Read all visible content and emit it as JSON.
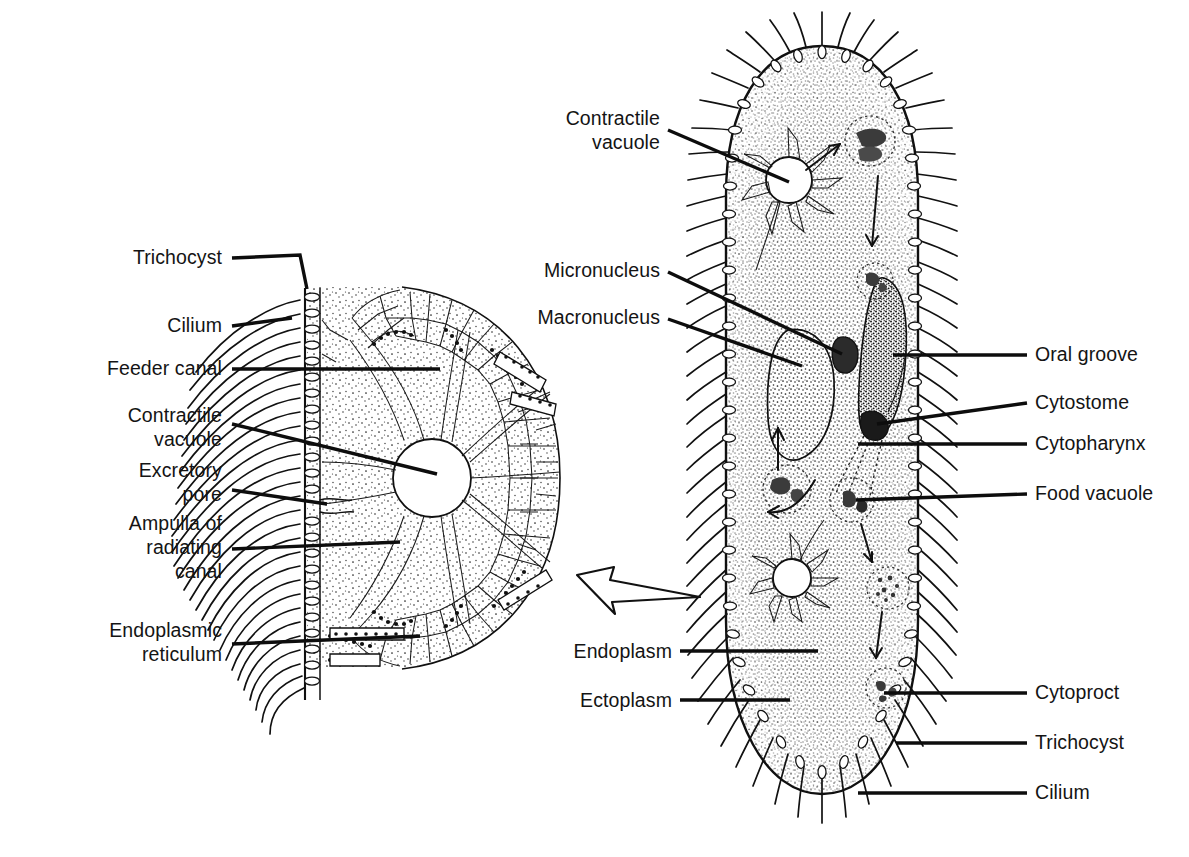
{
  "figure": {
    "background": "#ffffff",
    "ink": "#111111"
  },
  "labels_left": [
    {
      "id": "trichocyst",
      "text": "Trichocyst",
      "lines": [
        "Trichocyst"
      ]
    },
    {
      "id": "cilium",
      "text": "Cilium",
      "lines": [
        "Cilium"
      ]
    },
    {
      "id": "feeder-canal",
      "text": "Feeder canal",
      "lines": [
        "Feeder canal"
      ]
    },
    {
      "id": "contractile-vacuole",
      "text": "Contractile vacuole",
      "lines": [
        "Contractile",
        "vacuole"
      ]
    },
    {
      "id": "excretory-pore",
      "text": "Excretory pore",
      "lines": [
        "Excretory",
        "pore"
      ]
    },
    {
      "id": "ampulla",
      "text": "Ampulla of radiating canal",
      "lines": [
        "Ampulla of",
        "radiating",
        "canal"
      ]
    },
    {
      "id": "endoplasmic-reticulum",
      "text": "Endoplasmic reticulum",
      "lines": [
        "Endoplasmic",
        "reticulum"
      ]
    }
  ],
  "labels_center": [
    {
      "id": "contractile-vacuole-main",
      "text": "Contractile vacuole",
      "lines": [
        "Contractile",
        "vacuole"
      ]
    },
    {
      "id": "micronucleus",
      "text": "Micronucleus",
      "lines": [
        "Micronucleus"
      ]
    },
    {
      "id": "macronucleus",
      "text": "Macronucleus",
      "lines": [
        "Macronucleus"
      ]
    },
    {
      "id": "endoplasm",
      "text": "Endoplasm",
      "lines": [
        "Endoplasm"
      ]
    },
    {
      "id": "ectoplasm",
      "text": "Ectoplasm",
      "lines": [
        "Ectoplasm"
      ]
    }
  ],
  "labels_right": [
    {
      "id": "oral-groove",
      "text": "Oral groove"
    },
    {
      "id": "cytostome",
      "text": "Cytostome"
    },
    {
      "id": "cytopharynx",
      "text": "Cytopharynx"
    },
    {
      "id": "food-vacuole",
      "text": "Food vacuole"
    },
    {
      "id": "cytoproct",
      "text": "Cytoproct"
    },
    {
      "id": "trichocyst-r",
      "text": "Trichocyst"
    },
    {
      "id": "cilium-r",
      "text": "Cilium"
    }
  ],
  "text": {
    "trichocyst": "Trichocyst",
    "cilium": "Cilium",
    "feeder_canal": "Feeder canal",
    "contractile_l1": "Contractile",
    "contractile_l2": "vacuole",
    "excretory_l1": "Excretory",
    "excretory_l2": "pore",
    "ampulla_l1": "Ampulla of",
    "ampulla_l2": "radiating",
    "ampulla_l3": "canal",
    "er_l1": "Endoplasmic",
    "er_l2": "reticulum",
    "cv_main_l1": "Contractile",
    "cv_main_l2": "vacuole",
    "micronucleus": "Micronucleus",
    "macronucleus": "Macronucleus",
    "endoplasm": "Endoplasm",
    "ectoplasm": "Ectoplasm",
    "oral_groove": "Oral groove",
    "cytostome": "Cytostome",
    "cytopharynx": "Cytopharynx",
    "food_vacuole": "Food vacuole",
    "cytoproct": "Cytoproct",
    "trichocyst_r": "Trichocyst",
    "cilium_r": "Cilium"
  },
  "icons": {
    "transition_arrow": "hollow-curved-arrow-left",
    "flow_arrows": "food-vacuole-circulation-arrows"
  }
}
